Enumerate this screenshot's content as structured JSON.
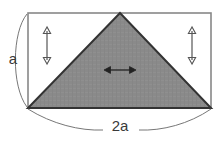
{
  "figure": {
    "type": "geometry-diagram",
    "background_color": "#ffffff",
    "canvas": {
      "width": 220,
      "height": 142
    },
    "rectangle": {
      "name": "bounding-rectangle",
      "x": 28,
      "y": 13,
      "width": 183,
      "height": 95,
      "stroke_color": "#888888",
      "fill_color": "#ffffff",
      "stroke_width": 1.6
    },
    "triangle": {
      "name": "shaded-triangle",
      "apex_x": 120,
      "apex_y": 13,
      "base_left_x": 28,
      "base_right_x": 211,
      "base_y": 108,
      "fill_color": "#8a8a8a",
      "stroke_color": "#333333",
      "stroke_width": 2
    },
    "arrows": [
      {
        "name": "left-height-arrow",
        "orientation": "vertical",
        "x": 47,
        "y_start": 28,
        "y_end": 63,
        "color": "#555555"
      },
      {
        "name": "right-height-arrow",
        "orientation": "vertical",
        "x": 192,
        "y_start": 28,
        "y_end": 63,
        "color": "#555555"
      },
      {
        "name": "center-width-arrow",
        "orientation": "horizontal",
        "y": 70,
        "x_start": 104,
        "x_end": 136,
        "color": "#222222"
      }
    ],
    "labels": {
      "height_label": "a",
      "base_label": "2a"
    },
    "label_positions": {
      "height_label_x": 13,
      "height_label_y": 60,
      "base_label_x": 120,
      "base_label_y": 127
    },
    "braces": {
      "left_brace": {
        "name": "left-dimension-brace",
        "path": "M 27 14 C 12 32, 11 86, 27 107",
        "stroke_color": "#777777"
      },
      "bottom_brace_left": {
        "name": "bottom-dimension-brace-left",
        "path": "M 28 109 C 52 124, 80 131, 103 130",
        "stroke_color": "#777777"
      },
      "bottom_brace_right": {
        "name": "bottom-dimension-brace-right",
        "path": "M 211 109 C 189 124, 162 131, 139 130",
        "stroke_color": "#777777"
      }
    }
  }
}
